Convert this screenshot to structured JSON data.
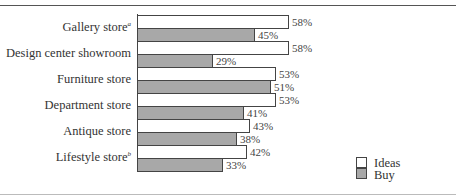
{
  "chart_data": {
    "type": "bar",
    "orientation": "horizontal",
    "title": "",
    "xlabel": "",
    "ylabel": "",
    "categories": [
      {
        "label": "Gallery store",
        "note": "a"
      },
      {
        "label": "Design center showroom",
        "note": ""
      },
      {
        "label": "Furniture store",
        "note": ""
      },
      {
        "label": "Department store",
        "note": ""
      },
      {
        "label": "Antique store",
        "note": ""
      },
      {
        "label": "Lifestyle store",
        "note": "b"
      }
    ],
    "series": [
      {
        "name": "Ideas",
        "color": "#ffffff",
        "values": [
          58,
          58,
          53,
          53,
          43,
          42
        ],
        "labels": [
          "58%",
          "58%",
          "53%",
          "53%",
          "43%",
          "42%"
        ]
      },
      {
        "name": "Buy",
        "color": "#a8a8a8",
        "values": [
          45,
          29,
          51,
          41,
          38,
          33
        ],
        "labels": [
          "45%",
          "29%",
          "51%",
          "41%",
          "38%",
          "33%"
        ]
      }
    ],
    "value_unit": "%",
    "grid": false,
    "legend_position": "bottom-right"
  },
  "legend": [
    {
      "label": "Ideas",
      "color": "#ffffff"
    },
    {
      "label": "Buy",
      "color": "#a8a8a8"
    }
  ]
}
